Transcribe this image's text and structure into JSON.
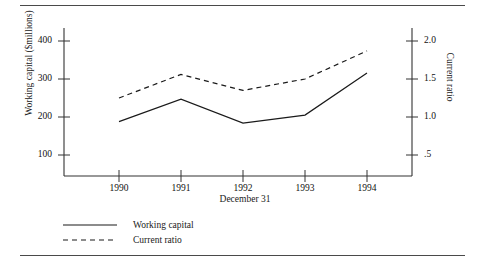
{
  "chart_data": {
    "type": "line",
    "title": "",
    "xlabel": "December 31",
    "categories": [
      "1990",
      "1991",
      "1992",
      "1993",
      "1994"
    ],
    "grid": false,
    "legend_position": "below-plot-left",
    "axes": {
      "left": {
        "label": "Working capital ($millions)",
        "ticks": [
          "100",
          "200",
          "300",
          "400"
        ],
        "tick_values": [
          100,
          200,
          300,
          400
        ],
        "ylim": [
          0,
          450
        ]
      },
      "right": {
        "label": "Current ratio",
        "ticks": [
          ".5",
          "1.0",
          "1.5",
          "2.0"
        ],
        "tick_values": [
          0.5,
          1.0,
          1.5,
          2.0
        ],
        "ylim": [
          0,
          2.25
        ]
      }
    },
    "series": [
      {
        "name": "Working capital",
        "style": "solid",
        "axis": "left",
        "values": [
          188,
          247,
          184,
          205,
          316
        ]
      },
      {
        "name": "Current ratio",
        "style": "dashed",
        "axis": "right",
        "values": [
          1.25,
          1.56,
          1.35,
          1.5,
          1.87
        ]
      }
    ]
  },
  "legend": {
    "entries": [
      {
        "label": "Working capital",
        "style": "solid"
      },
      {
        "label": "Current ratio",
        "style": "dashed"
      }
    ]
  }
}
